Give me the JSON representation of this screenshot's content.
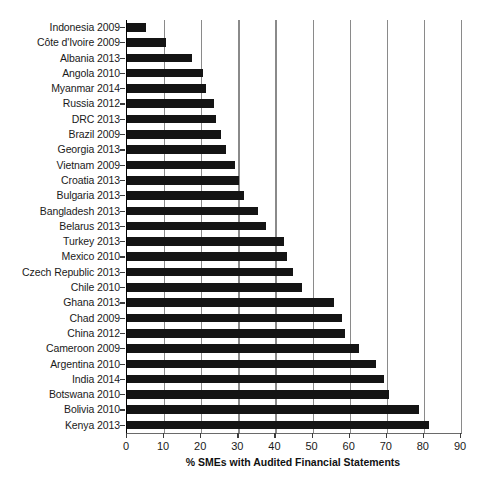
{
  "chart_data": {
    "type": "bar",
    "orientation": "horizontal",
    "title": "",
    "subtitle": "",
    "xlabel": "% SMEs with Audited Financial Statements",
    "ylabel": "",
    "xlim": [
      0,
      90
    ],
    "xticks": [
      0,
      10,
      20,
      30,
      40,
      50,
      60,
      70,
      80,
      90
    ],
    "xtick_labels": [
      "0",
      "10",
      "20",
      "30",
      "40",
      "50",
      "60",
      "70",
      "80",
      "90"
    ],
    "grid": "vertical",
    "legend": "none",
    "bar_color": "#141414",
    "gridline_color": "#8a8a8a",
    "categories": [
      "Indonesia 2009",
      "Côte d'Ivoire 2009",
      "Albania 2013",
      "Angola 2010",
      "Myanmar 2014",
      "Russia 2012",
      "DRC 2013",
      "Brazil 2009",
      "Georgia 2013",
      "Vietnam 2009",
      "Croatia 2013",
      "Bulgaria 2013",
      "Bangladesh 2013",
      "Belarus 2013",
      "Turkey 2013",
      "Mexico 2010",
      "Czech Republic 2013",
      "Chile 2010",
      "Ghana 2013",
      "Chad 2009",
      "China 2012",
      "Cameroon 2009",
      "Argentina 2010",
      "India 2014",
      "Botswana 2010",
      "Bolivia 2010",
      "Kenya 2013"
    ],
    "values": [
      5.1,
      10.6,
      17.6,
      20.4,
      21.2,
      23.5,
      24.0,
      25.2,
      26.6,
      29.2,
      30.3,
      31.6,
      35.2,
      37.4,
      42.2,
      43.2,
      44.7,
      47.2,
      55.8,
      58.0,
      58.7,
      62.5,
      67.2,
      69.3,
      70.5,
      78.8,
      81.4
    ]
  }
}
